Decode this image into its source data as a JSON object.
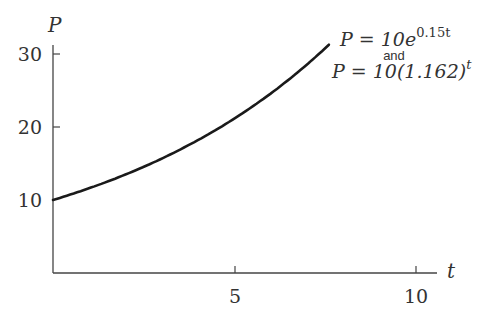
{
  "chart_data": {
    "type": "line",
    "title": "",
    "xlabel": "t",
    "ylabel": "P",
    "xlim": [
      0,
      10.5
    ],
    "ylim": [
      0,
      32
    ],
    "x_ticks": [
      5,
      10
    ],
    "x_tick_labels": [
      "5",
      "10"
    ],
    "y_ticks": [
      10,
      20,
      30
    ],
    "y_tick_labels": [
      "10",
      "20",
      "30"
    ],
    "grid": false,
    "legend": null,
    "series": [
      {
        "name": "P = 10e^{0.15t} and P = 10(1.162)^t",
        "function": "10*exp(0.15*t)",
        "x": [
          0,
          1,
          2,
          3,
          4,
          5,
          6,
          7,
          7.6
        ],
        "y": [
          10,
          11.6,
          13.5,
          15.7,
          18.2,
          21.2,
          24.6,
          28.6,
          31.3
        ]
      }
    ],
    "annotations": [
      {
        "line1_main": "P = 10e",
        "line1_exp": "0.15t",
        "connector": "and",
        "line2_main": "P = 10(1.162)",
        "line2_exp": "t"
      }
    ]
  },
  "labels": {
    "y_axis": "P",
    "x_axis": "t",
    "y_ticks": [
      "10",
      "20",
      "30"
    ],
    "x_ticks": [
      "5",
      "10"
    ],
    "annotation": {
      "eq1_main": "P = 10e",
      "eq1_exp": "0.15t",
      "connector": "and",
      "eq2_main": "P = 10(1.162)",
      "eq2_exp": "t"
    }
  }
}
